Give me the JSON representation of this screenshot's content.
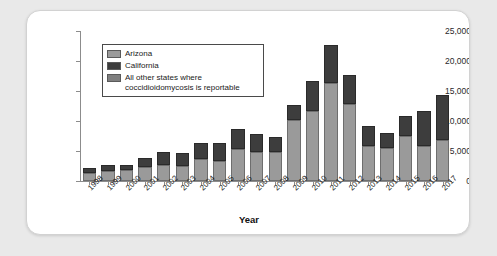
{
  "chart_data": {
    "type": "bar",
    "subtype": "stacked-bar",
    "title": "",
    "xlabel": "Year",
    "ylabel": "",
    "ylim": [
      0,
      25000
    ],
    "ytick_labels": [
      "0",
      "5,000",
      "10,000",
      "15,000",
      "20,000",
      "25,000"
    ],
    "yticks": [
      0,
      5000,
      10000,
      15000,
      20000,
      25000
    ],
    "grid": false,
    "legend_position": "upper-left-inside",
    "categories": [
      "1998",
      "1999",
      "2000",
      "2001",
      "2002",
      "2003",
      "2004",
      "2005",
      "2006",
      "2007",
      "2008",
      "2009",
      "2010",
      "2011",
      "2012",
      "2013",
      "2014",
      "2015",
      "2016",
      "2017"
    ],
    "series": [
      {
        "name": "Arizona",
        "color": "#9a9a9a",
        "values": [
          1400,
          1700,
          1800,
          2300,
          2700,
          2500,
          3600,
          3400,
          5300,
          4800,
          4800,
          10200,
          11700,
          16300,
          12800,
          5900,
          5500,
          7500,
          5900,
          6800
        ]
      },
      {
        "name": "California",
        "color": "#3d3d3d",
        "values": [
          800,
          900,
          800,
          1500,
          2200,
          2200,
          2700,
          2900,
          3400,
          3100,
          2500,
          2500,
          4900,
          6300,
          4800,
          3300,
          2500,
          3400,
          5700,
          7500
        ]
      }
    ],
    "totals": [
      2200,
      2600,
      2600,
      3800,
      4900,
      4700,
      6300,
      6300,
      8700,
      7900,
      7300,
      12700,
      16600,
      22600,
      17600,
      9200,
      8000,
      10900,
      11600,
      14300
    ]
  },
  "legend": {
    "items": [
      {
        "label": "Arizona",
        "swatch": "#9a9a9a"
      },
      {
        "label": "California",
        "swatch": "#3d3d3d"
      },
      {
        "label": "All other states where coccidioidomycosis is reportable",
        "swatch": "#7f7f7f"
      }
    ]
  },
  "axis": {
    "x_title": "Year"
  },
  "colors": {
    "arizona": "#9a9a9a",
    "california": "#3d3d3d",
    "other_states": "#7f7f7f",
    "page_background": "#e9e9e9",
    "card_background": "#ffffff",
    "axis": "#8c8c8c"
  }
}
